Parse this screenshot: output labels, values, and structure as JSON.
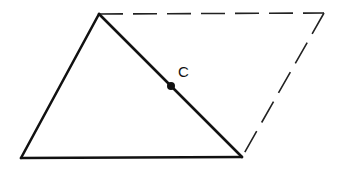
{
  "diagram": {
    "type": "geometry",
    "colors": {
      "line": "#111111",
      "dashed": "#222222",
      "background": "#ffffff"
    },
    "vertices": {
      "top_left": [
        99,
        14
      ],
      "top_right": [
        324,
        13
      ],
      "bottom_right": [
        242,
        157
      ],
      "bottom_left": [
        21,
        158
      ]
    },
    "solid_edges": [
      [
        "bottom_left",
        "top_left"
      ],
      [
        "top_left",
        "bottom_right"
      ],
      [
        "bottom_left",
        "bottom_right"
      ]
    ],
    "dashed_edges": [
      [
        "top_left",
        "top_right"
      ],
      [
        "top_right",
        "bottom_right"
      ]
    ],
    "points": [
      {
        "id": "C",
        "label": "C",
        "position": [
          171,
          86
        ],
        "label_position": [
          178,
          77
        ]
      }
    ]
  }
}
